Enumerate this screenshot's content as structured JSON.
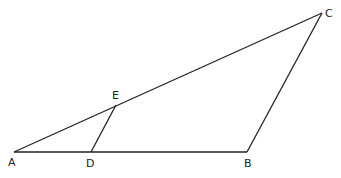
{
  "diagram": {
    "type": "triangle",
    "points": {
      "A": {
        "label": "A",
        "x": 14,
        "y": 152
      },
      "B": {
        "label": "B",
        "x": 247,
        "y": 152
      },
      "C": {
        "label": "C",
        "x": 322,
        "y": 13
      },
      "D": {
        "label": "D",
        "x": 91,
        "y": 152
      },
      "E": {
        "label": "E",
        "x": 116,
        "y": 105
      }
    },
    "segments": [
      "AB",
      "BC",
      "CA",
      "DE"
    ],
    "labels": {
      "A": "A",
      "B": "B",
      "C": "C",
      "D": "D",
      "E": "E"
    }
  }
}
